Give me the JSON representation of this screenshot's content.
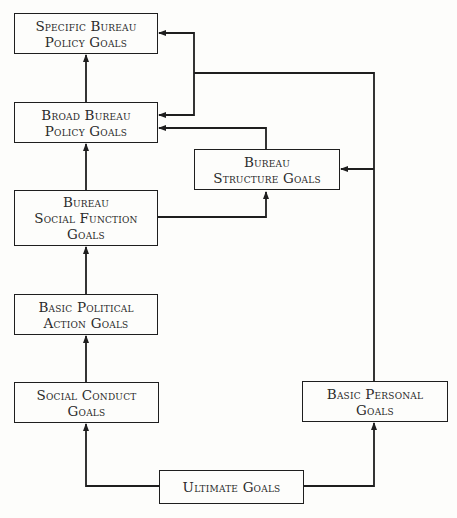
{
  "diagram": {
    "nodes": {
      "specific": {
        "line1": "Specific Bureau",
        "line2": "Policy Goals"
      },
      "broad": {
        "line1": "Broad Bureau",
        "line2": "Policy Goals"
      },
      "structure": {
        "line1": "Bureau",
        "line2": "Structure Goals"
      },
      "social_function": {
        "line1": "Bureau",
        "line2": "Social Function",
        "line3": "Goals"
      },
      "political": {
        "line1": "Basic Political",
        "line2": "Action Goals"
      },
      "conduct": {
        "line1": "Social Conduct",
        "line2": "Goals"
      },
      "personal": {
        "line1": "Basic Personal",
        "line2": "Goals"
      },
      "ultimate": {
        "line1": "Ultimate Goals"
      }
    },
    "edges": [
      {
        "from": "ultimate",
        "to": "conduct"
      },
      {
        "from": "ultimate",
        "to": "personal"
      },
      {
        "from": "conduct",
        "to": "political"
      },
      {
        "from": "political",
        "to": "social_function"
      },
      {
        "from": "social_function",
        "to": "broad"
      },
      {
        "from": "social_function",
        "to": "structure"
      },
      {
        "from": "structure",
        "to": "broad"
      },
      {
        "from": "broad",
        "to": "specific"
      },
      {
        "from": "personal",
        "to": "structure"
      },
      {
        "from": "personal",
        "to": "broad"
      },
      {
        "from": "personal",
        "to": "specific"
      }
    ],
    "colors": {
      "line": "#1e1e1e",
      "background": "#fdfdfb",
      "text": "#2a2a2a"
    }
  }
}
